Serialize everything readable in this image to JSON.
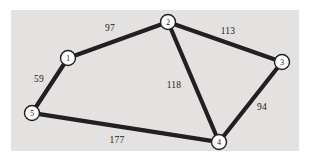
{
  "figure": {
    "name": "weighted-undirected-graph",
    "background_color": "#ffffff",
    "panel_color": "#e4e2e0",
    "edge_color": "#231f20",
    "node_fill": "#fdfdfd",
    "node_stroke": "#231f20",
    "text_color": "#1a1a1a",
    "panel": {
      "x": 11,
      "y": 10,
      "width": 288,
      "height": 141
    }
  },
  "chart_data": {
    "type": "diagram",
    "subtype": "node-link-graph",
    "title": "",
    "directed": false,
    "weighted": true,
    "nodes": [
      {
        "id": "1",
        "label": "1",
        "x": 68,
        "y": 58,
        "r": 7.5
      },
      {
        "id": "2",
        "label": "2",
        "x": 168,
        "y": 22,
        "r": 7.5
      },
      {
        "id": "3",
        "label": "3",
        "x": 282,
        "y": 62,
        "r": 7.5
      },
      {
        "id": "4",
        "label": "4",
        "x": 219,
        "y": 142,
        "r": 7.5
      },
      {
        "id": "5",
        "label": "5",
        "x": 32,
        "y": 113,
        "r": 7.5
      }
    ],
    "edges": [
      {
        "source": "1",
        "target": "2",
        "weight": 97,
        "label": "97",
        "label_x": 110,
        "label_y": 28
      },
      {
        "source": "2",
        "target": "3",
        "weight": 113,
        "label": "113",
        "label_x": 228,
        "label_y": 31
      },
      {
        "source": "2",
        "target": "4",
        "weight": 118,
        "label": "118",
        "label_x": 174,
        "label_y": 85
      },
      {
        "source": "3",
        "target": "4",
        "weight": 94,
        "label": "94",
        "label_x": 262,
        "label_y": 107
      },
      {
        "source": "1",
        "target": "5",
        "weight": 59,
        "label": "59",
        "label_x": 39,
        "label_y": 79
      },
      {
        "source": "5",
        "target": "4",
        "weight": 177,
        "label": "177",
        "label_x": 117,
        "label_y": 140
      }
    ],
    "node_labels": [
      "1",
      "2",
      "3",
      "4",
      "5"
    ],
    "edge_labels": [
      "97",
      "113",
      "118",
      "94",
      "59",
      "177"
    ],
    "edge_stroke_width": 4.2,
    "legend": null,
    "axes": null,
    "grid": false
  }
}
